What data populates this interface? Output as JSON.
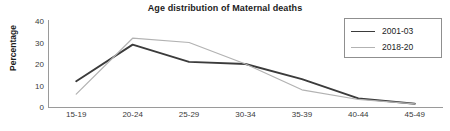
{
  "chart_data": {
    "type": "line",
    "title": "Age distribution of Maternal deaths",
    "xlabel": "",
    "ylabel": "Percentage",
    "categories": [
      "15-19",
      "20-24",
      "25-29",
      "30-34",
      "35-39",
      "40-44",
      "45-49"
    ],
    "yticks": [
      0,
      10,
      20,
      30,
      40
    ],
    "ylim": [
      0,
      40
    ],
    "grid": false,
    "legend_position": "top-right",
    "series": [
      {
        "name": "2001-03",
        "color": "#3b3b3b",
        "values": [
          12,
          29,
          21,
          20,
          13,
          4,
          1.5
        ]
      },
      {
        "name": "2018-20",
        "color": "#b2b2b2",
        "values": [
          6,
          32,
          30,
          20,
          8,
          3.5,
          1.5
        ]
      }
    ]
  }
}
